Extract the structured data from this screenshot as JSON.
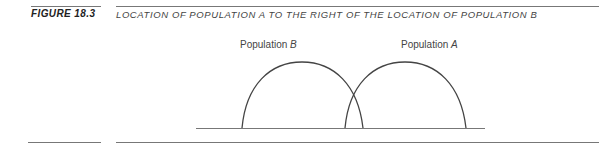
{
  "figure": {
    "label": "FIGURE 18.3",
    "title": "LOCATION OF POPULATION A TO THE RIGHT OF THE LOCATION OF POPULATION B"
  },
  "diagram": {
    "populations": [
      {
        "name": "Population",
        "letter": "B",
        "position": "left"
      },
      {
        "name": "Population",
        "letter": "A",
        "position": "right"
      }
    ]
  }
}
